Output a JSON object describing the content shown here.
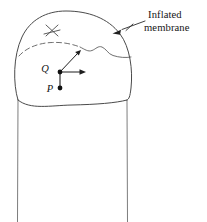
{
  "figure": {
    "type": "technical-line-diagram",
    "width": 207,
    "height": 222,
    "background_color": "#ffffff"
  },
  "callout": {
    "line1": "Inflated",
    "line2": "membrane",
    "full_text": "Inflated membrane",
    "leader_from": [
      146,
      22
    ],
    "leader_to": [
      113,
      34
    ],
    "arrow_at": "membrane-outline"
  },
  "labels": {
    "point_q": "Q",
    "point_p": "P"
  },
  "points": {
    "q": {
      "label": "Q",
      "x": 60,
      "y": 72
    },
    "p": {
      "label": "P",
      "x": 60,
      "y": 88
    }
  },
  "vectors": [
    {
      "name": "diagonal-vector",
      "from": [
        60,
        72
      ],
      "to": [
        80,
        50
      ]
    },
    {
      "name": "horizontal-vector",
      "from": [
        60,
        72
      ],
      "to": [
        85,
        72
      ]
    }
  ],
  "connector": {
    "name": "pq-segment",
    "from": [
      60,
      72
    ],
    "to": [
      60,
      88
    ]
  },
  "marks": {
    "cross_mark": {
      "name": "cross-mark",
      "center": [
        52,
        31
      ],
      "size": 11
    }
  },
  "geometry": {
    "membrane_dome": "bulging inflated dome cap",
    "tube_left_wall_x": 18,
    "tube_right_wall_x": 127,
    "tube_top_y": 100,
    "tube_bottom_y": 222,
    "inner_contour": "dashed wavy internal boundary curve"
  },
  "colors": {
    "outline": "#4a4a4a",
    "tube_wall": "#6e6e6e",
    "vector": "#1f1f1f",
    "dot": "#111111",
    "text": "#151515",
    "background": "#ffffff"
  }
}
